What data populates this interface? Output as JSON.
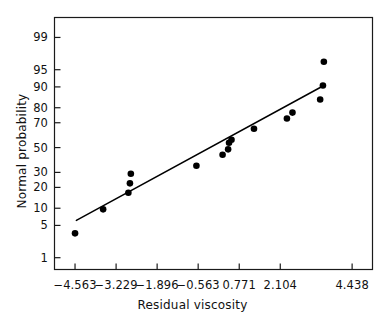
{
  "chart_data": {
    "type": "scatter",
    "title": "",
    "xlabel": "Residual viscosity",
    "ylabel": "Normal probability",
    "xtick_labels": [
      "−4.563",
      "−3.229",
      "−1.896",
      "−0.563",
      "0.771",
      "2.104",
      "4.438"
    ],
    "xtick_values": [
      -4.563,
      -3.229,
      -1.896,
      -0.563,
      0.771,
      2.104,
      4.438
    ],
    "ytick_labels": [
      "99",
      "95",
      "90",
      "80",
      "70",
      "50",
      "30",
      "20",
      "10",
      "5",
      "1"
    ],
    "ytick_values": [
      99,
      95,
      90,
      80,
      70,
      50,
      30,
      20,
      10,
      5,
      1
    ],
    "xlim": [
      -5.23,
      5.1
    ],
    "ylim": [
      0.5,
      99.7
    ],
    "grid": false,
    "legend": null,
    "marker": "filled-circle",
    "marker_color": "#000000",
    "line_color": "#000000",
    "points": [
      {
        "x": -4.563,
        "y": 3.5
      },
      {
        "x": -3.65,
        "y": 9.6
      },
      {
        "x": -2.83,
        "y": 17.0
      },
      {
        "x": -2.78,
        "y": 22.5
      },
      {
        "x": -2.75,
        "y": 29.0
      },
      {
        "x": -0.62,
        "y": 35.0
      },
      {
        "x": 0.23,
        "y": 44.0
      },
      {
        "x": 0.41,
        "y": 48.5
      },
      {
        "x": 0.44,
        "y": 54.0
      },
      {
        "x": 0.52,
        "y": 56.5
      },
      {
        "x": 1.25,
        "y": 65.5
      },
      {
        "x": 2.32,
        "y": 73.0
      },
      {
        "x": 2.5,
        "y": 77.0
      },
      {
        "x": 3.4,
        "y": 84.5
      },
      {
        "x": 3.49,
        "y": 90.5
      },
      {
        "x": 3.52,
        "y": 96.5
      }
    ],
    "fit_line": {
      "x_start": -4.52,
      "y_start": 6.2,
      "x_end": 3.52,
      "y_end": 90.5
    }
  }
}
